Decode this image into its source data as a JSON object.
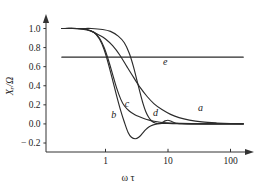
{
  "chart_data": {
    "type": "line",
    "title": "",
    "subtitle": "",
    "xlabel": "ω τ",
    "ylabel": "Xᵣ/Ω",
    "xscale": "log",
    "yscale": "linear",
    "xlim": [
      0.2,
      180
    ],
    "ylim": [
      -0.28,
      1.08
    ],
    "xticks": [
      1,
      10,
      100
    ],
    "xtick_labels": [
      "1",
      "10",
      "100"
    ],
    "yticks": [
      -0.2,
      0.0,
      0.2,
      0.4,
      0.6,
      0.8,
      1.0
    ],
    "ytick_labels": [
      "− 0.2",
      "0.0",
      "0.2",
      "0.4",
      "0.6",
      "0.8",
      "1.0"
    ],
    "grid": false,
    "legend": "inline-curve-labels",
    "series": [
      {
        "name": "a",
        "label": "a",
        "label_x": 33,
        "label_y": 0.14,
        "x": [
          0.2,
          0.3,
          0.45,
          0.6,
          0.8,
          1.0,
          1.3,
          1.7,
          2.2,
          2.8,
          3.6,
          4.6,
          6.0,
          8.0,
          11.0,
          15.0,
          22.0,
          35.0,
          60.0,
          100.0,
          160.0
        ],
        "y": [
          1.0,
          1.0,
          0.99,
          0.97,
          0.93,
          0.89,
          0.82,
          0.72,
          0.6,
          0.49,
          0.38,
          0.29,
          0.21,
          0.15,
          0.1,
          0.066,
          0.04,
          0.021,
          0.01,
          0.004,
          0.002
        ]
      },
      {
        "name": "b",
        "label": "b",
        "label_x": 1.35,
        "label_y": 0.06,
        "x": [
          0.2,
          0.35,
          0.5,
          0.65,
          0.8,
          0.95,
          1.1,
          1.3,
          1.5,
          1.75,
          2.0,
          2.3,
          2.6,
          3.0,
          3.4,
          3.9,
          4.4,
          5.0,
          5.8,
          6.8,
          8.0,
          10.0,
          14.0,
          20.0,
          35.0,
          70.0,
          160.0
        ],
        "y": [
          1.0,
          1.0,
          0.99,
          0.96,
          0.89,
          0.78,
          0.64,
          0.46,
          0.3,
          0.14,
          0.02,
          -0.09,
          -0.14,
          -0.155,
          -0.14,
          -0.1,
          -0.06,
          -0.03,
          -0.01,
          0.0,
          0.005,
          0.005,
          0.002,
          0.0,
          0.0,
          0.0,
          0.0
        ]
      },
      {
        "name": "c",
        "label": "c",
        "label_x": 2.2,
        "label_y": 0.175,
        "x": [
          0.2,
          0.35,
          0.5,
          0.65,
          0.8,
          0.95,
          1.1,
          1.3,
          1.5,
          1.75,
          2.0,
          2.4,
          2.9,
          3.5,
          4.2,
          5.0,
          6.0,
          7.5,
          9.5,
          12.0,
          16.0,
          24.0,
          40.0,
          80.0,
          160.0
        ],
        "y": [
          1.0,
          1.0,
          0.99,
          0.96,
          0.9,
          0.8,
          0.68,
          0.52,
          0.38,
          0.26,
          0.19,
          0.135,
          0.1,
          0.075,
          0.055,
          0.04,
          0.028,
          0.018,
          0.012,
          0.008,
          0.005,
          0.003,
          0.001,
          0.0,
          0.0
        ]
      },
      {
        "name": "d",
        "label": "d",
        "label_x": 6.3,
        "label_y": 0.085,
        "x": [
          0.2,
          0.4,
          0.6,
          0.9,
          1.2,
          1.6,
          2.0,
          2.4,
          2.8,
          3.2,
          3.6,
          4.0,
          4.4,
          4.9,
          5.5,
          6.2,
          7.0,
          8.0,
          9.0,
          10.0,
          11.0,
          12.5,
          14.0,
          17.0,
          22.0,
          30.0,
          50.0,
          100.0,
          160.0
        ],
        "y": [
          1.0,
          1.0,
          1.0,
          0.99,
          0.97,
          0.92,
          0.85,
          0.74,
          0.6,
          0.45,
          0.32,
          0.21,
          0.13,
          0.07,
          0.03,
          0.01,
          0.005,
          0.015,
          0.032,
          0.038,
          0.03,
          0.015,
          0.006,
          0.002,
          0.0,
          0.0,
          0.0,
          0.0,
          0.0
        ]
      },
      {
        "name": "e",
        "label": "e",
        "label_x": 9.0,
        "label_y": 0.615,
        "constant": 0.7,
        "x": [
          0.2,
          160.0
        ],
        "y": [
          0.7,
          0.7
        ]
      }
    ]
  }
}
